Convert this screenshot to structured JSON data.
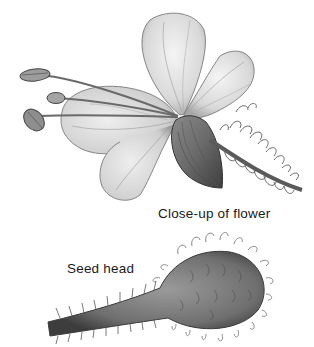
{
  "illustration": {
    "background": "#ffffff",
    "ink_color": "#3a3a3a",
    "flower": {
      "label": "Close-up of flower",
      "parts": [
        "petals",
        "stamens",
        "sepal",
        "bristly stem"
      ]
    },
    "seed_head": {
      "label": "Seed head",
      "parts": [
        "bulbous head",
        "bristly stalk"
      ]
    }
  }
}
